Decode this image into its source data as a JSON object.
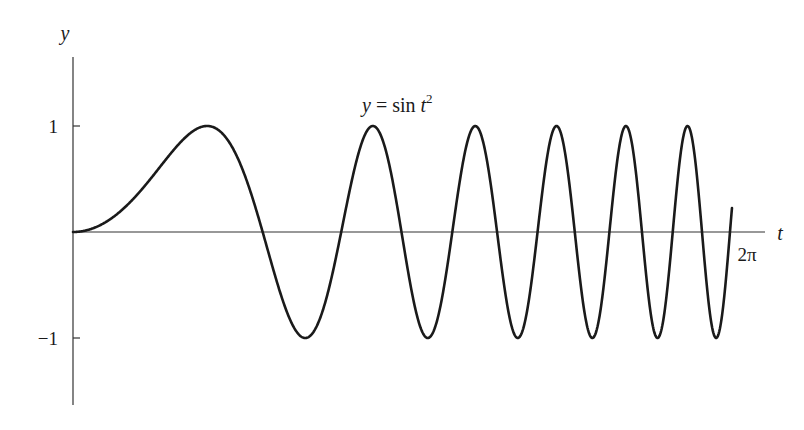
{
  "chart_data": {
    "type": "line",
    "title": "",
    "function": "y = sin t^2",
    "annotation": {
      "text_y": "y",
      "text_eq": " = sin ",
      "text_t": "t",
      "text_sup": "2"
    },
    "xlabel": "t",
    "ylabel": "y",
    "x_tick_labels": [
      "2π"
    ],
    "y_tick_labels": [
      "1",
      "−1"
    ],
    "y_ticks": [
      1,
      -1
    ],
    "xlim": [
      0,
      6.16
    ],
    "ylim": [
      -1.65,
      1.65
    ],
    "grid": false,
    "legend": "none",
    "series": [
      {
        "name": "sin t^2",
        "t_start": 0,
        "t_end": 6.1585,
        "samples": 1200
      }
    ],
    "key_points": {
      "peaks_t": [
        1.2533,
        2.8025,
        3.7599,
        4.4966,
        5.1166,
        5.6636,
        6.1585
      ],
      "troughs_t": [
        2.1708,
        3.3631,
        4.142,
        4.8165,
        5.405,
        5.9394
      ],
      "peak_value": 1,
      "trough_value": -1
    }
  },
  "layout": {
    "origin_x": 73,
    "origin_y": 232,
    "px_per_t": 107,
    "px_per_y": 106,
    "y_axis_top": 57,
    "y_axis_bottom": 405,
    "x_axis_right": 765,
    "line_color": "#1a1a1a"
  }
}
